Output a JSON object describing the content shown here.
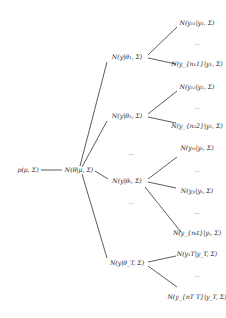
{
  "root": {
    "label": "p(μ, Σ)"
  },
  "theta": {
    "label": "N(θ|μ, Σ)"
  },
  "groups": [
    {
      "label": "N(y|θ₁, Σ)",
      "leaves": [
        "N(y₁₁|y₁, Σ)",
        "N(y_{n₁1}|y₁, Σ)"
      ],
      "dots": "..."
    },
    {
      "label": "N(y|θ₂, Σ)",
      "leaves": [
        "N(y₁₂|y₂, Σ)",
        "N(y_{n₂2}|y₂, Σ)"
      ],
      "dots": "..."
    },
    {
      "label": "N(y|θₜ, Σ)",
      "leaves": [
        "N(y₁ₜ|yₜ, Σ)",
        "N(yⱼₜ|yₜ, Σ)",
        "N(y_{nₜt}|yₜ, Σ)"
      ],
      "dots": "..."
    },
    {
      "label": "N(y|θ_T, Σ)",
      "leaves": [
        "N(y₁T|y_T, Σ)",
        "N(y_{nT T}|y_T, Σ)"
      ],
      "dots": "..."
    }
  ],
  "ellipsis": "..."
}
